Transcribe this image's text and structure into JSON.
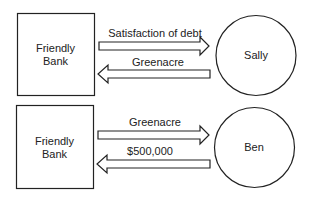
{
  "diagram": {
    "colors": {
      "stroke": "#222222",
      "background": "#ffffff"
    },
    "transactions": [
      {
        "left_party": "Friendly\nBank",
        "left_party_line1": "Friendly",
        "left_party_line2": "Bank",
        "right_party": "Sally",
        "arrows": [
          {
            "direction": "right",
            "label": "Satisfaction of debt"
          },
          {
            "direction": "left",
            "label": "Greenacre"
          }
        ]
      },
      {
        "left_party": "Friendly\nBank",
        "left_party_line1": "Friendly",
        "left_party_line2": "Bank",
        "right_party": "Ben",
        "arrows": [
          {
            "direction": "right",
            "label": "Greenacre"
          },
          {
            "direction": "left",
            "label": "$500,000"
          }
        ]
      }
    ]
  }
}
